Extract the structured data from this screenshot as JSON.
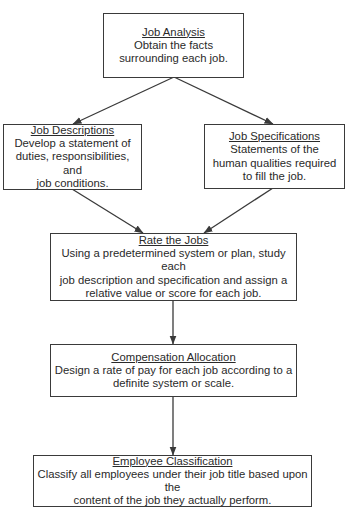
{
  "diagram": {
    "type": "flowchart",
    "nodes": [
      {
        "id": "job-analysis",
        "title": "Job Analysis",
        "body": "Obtain the facts\nsurrounding each job."
      },
      {
        "id": "job-descriptions",
        "title": "Job Descriptions",
        "body": "Develop a statement of\nduties, responsibilities, and\njob conditions."
      },
      {
        "id": "job-specifications",
        "title": "Job Specifications",
        "body": "Statements of the\nhuman qualities required\nto fill the job."
      },
      {
        "id": "rate-the-jobs",
        "title": "Rate the Jobs",
        "body": "Using a predetermined system or plan, study each\njob description and specification and assign a\nrelative value or score for each job."
      },
      {
        "id": "compensation-allocation",
        "title": "Compensation Allocation",
        "body": "Design a rate of pay for each job according to a\ndefinite system or scale."
      },
      {
        "id": "employee-classification",
        "title": "Employee Classification",
        "body": "Classify all employees under their job title based upon the\ncontent of the job they actually perform."
      }
    ],
    "edges": [
      {
        "from": "job-analysis",
        "to": "job-descriptions"
      },
      {
        "from": "job-analysis",
        "to": "job-specifications"
      },
      {
        "from": "job-descriptions",
        "to": "rate-the-jobs"
      },
      {
        "from": "job-specifications",
        "to": "rate-the-jobs"
      },
      {
        "from": "rate-the-jobs",
        "to": "compensation-allocation"
      },
      {
        "from": "compensation-allocation",
        "to": "employee-classification"
      }
    ],
    "colors": {
      "line": "#3a3a3a",
      "box_fill": "#ffffff",
      "text": "#2a2a2a"
    }
  }
}
